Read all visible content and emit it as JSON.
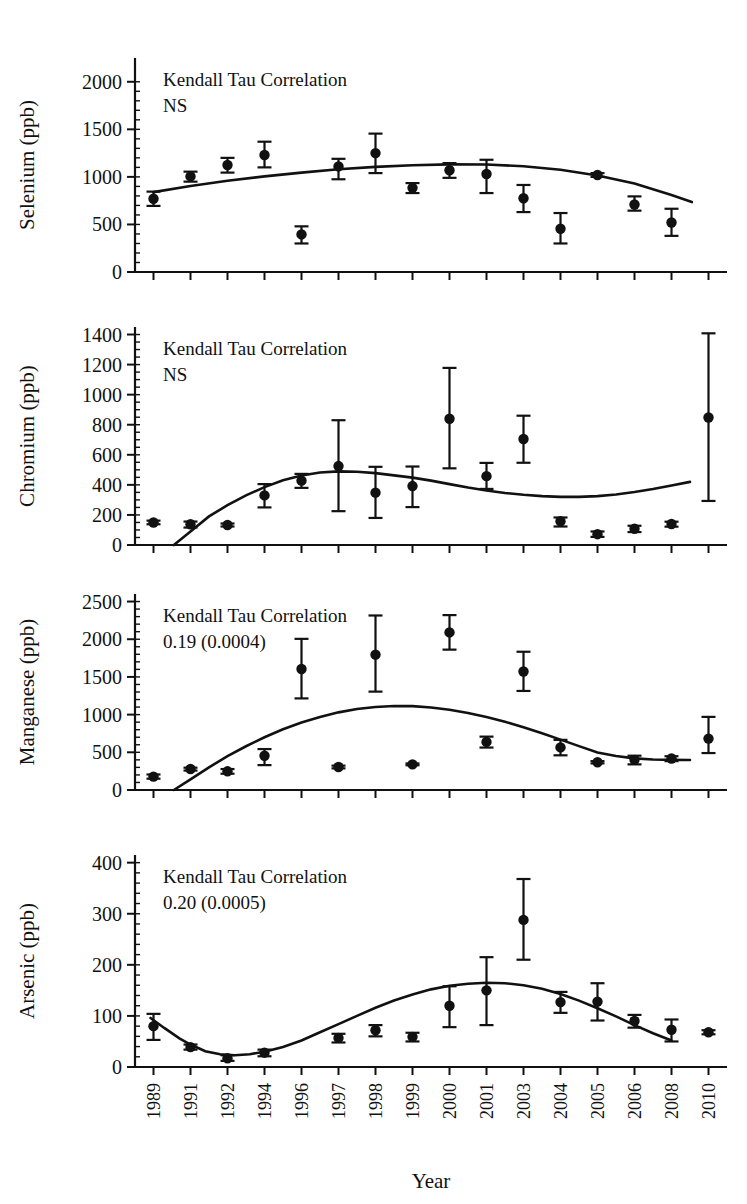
{
  "figure": {
    "top_partial_text": " ",
    "xaxis_title": "Year",
    "categories": [
      "1989",
      "1991",
      "1992",
      "1994",
      "1996",
      "1997",
      "1998",
      "1999",
      "2000",
      "2001",
      "2003",
      "2004",
      "2005",
      "2006",
      "2008",
      "2010"
    ]
  },
  "chart_data": [
    {
      "type": "scatter",
      "title": "",
      "panel_name": "selenium",
      "xlabel": "Year",
      "ylabel": "Selenium (ppb)",
      "ylim": [
        0,
        2250
      ],
      "yticks": [
        0,
        500,
        1000,
        1500,
        2000
      ],
      "yminor_step": 100,
      "grid": false,
      "legend": "none",
      "annotation_line1": "Kendall Tau Correlation",
      "annotation_line2": "NS",
      "categories": [
        "1989",
        "1991",
        "1992",
        "1994",
        "1996",
        "1997",
        "1998",
        "1999",
        "2000",
        "2001",
        "2003",
        "2004",
        "2005",
        "2006",
        "2008",
        "2010"
      ],
      "values": [
        770,
        1005,
        1125,
        1230,
        395,
        1110,
        1250,
        885,
        1070,
        1030,
        775,
        455,
        1020,
        710,
        520,
        null
      ],
      "err_low": [
        75,
        55,
        80,
        130,
        95,
        135,
        210,
        55,
        80,
        200,
        145,
        155,
        20,
        65,
        140,
        null
      ],
      "err_high": [
        75,
        50,
        75,
        140,
        85,
        80,
        205,
        50,
        75,
        150,
        140,
        165,
        20,
        85,
        145,
        null
      ],
      "x_index": [
        0,
        1,
        2,
        3,
        4,
        5,
        6,
        7,
        8,
        9,
        10,
        11,
        12,
        13,
        14,
        null
      ],
      "fit_points": [
        [
          0.0,
          840
        ],
        [
          1.0,
          905
        ],
        [
          2.0,
          960
        ],
        [
          3.0,
          1005
        ],
        [
          4.0,
          1045
        ],
        [
          5.0,
          1080
        ],
        [
          6.0,
          1105
        ],
        [
          7.0,
          1122
        ],
        [
          8.0,
          1132
        ],
        [
          9.0,
          1130
        ],
        [
          10.0,
          1112
        ],
        [
          11.0,
          1075
        ],
        [
          12.0,
          1015
        ],
        [
          13.0,
          930
        ],
        [
          14.0,
          810
        ],
        [
          14.55,
          735
        ]
      ],
      "extra_point_note": "2010 point at ~520 plotted at index 15"
    },
    {
      "type": "scatter",
      "title": "",
      "panel_name": "chromium",
      "xlabel": "Year",
      "ylabel": "Chromium (ppb)",
      "ylim": [
        0,
        1450
      ],
      "yticks": [
        0,
        200,
        400,
        600,
        800,
        1000,
        1200,
        1400
      ],
      "yminor_step": 50,
      "grid": false,
      "legend": "none",
      "annotation_line1": "Kendall Tau Correlation",
      "annotation_line2": "NS",
      "categories": [
        "1989",
        "1991",
        "1992",
        "1994",
        "1996",
        "1997",
        "1998",
        "1999",
        "2000",
        "2001",
        "2003",
        "2004",
        "2005",
        "2006",
        "2008",
        "2010"
      ],
      "values": [
        150,
        138,
        133,
        330,
        428,
        525,
        348,
        392,
        840,
        458,
        705,
        158,
        72,
        108,
        140,
        848
      ],
      "err_low": [
        12,
        22,
        10,
        80,
        48,
        300,
        168,
        140,
        330,
        85,
        158,
        35,
        18,
        22,
        18,
        555
      ],
      "err_high": [
        12,
        18,
        10,
        75,
        45,
        305,
        172,
        130,
        338,
        88,
        155,
        25,
        18,
        20,
        15,
        560
      ],
      "fit_points": [
        [
          0.55,
          0
        ],
        [
          1.0,
          90
        ],
        [
          1.5,
          190
        ],
        [
          2.0,
          265
        ],
        [
          2.5,
          330
        ],
        [
          3.0,
          385
        ],
        [
          3.5,
          430
        ],
        [
          4.0,
          462
        ],
        [
          4.5,
          482
        ],
        [
          5.0,
          490
        ],
        [
          5.5,
          487
        ],
        [
          6.0,
          478
        ],
        [
          6.5,
          463
        ],
        [
          7.0,
          448
        ],
        [
          7.5,
          428
        ],
        [
          8.0,
          405
        ],
        [
          8.5,
          382
        ],
        [
          9.0,
          362
        ],
        [
          9.5,
          346
        ],
        [
          10.0,
          334
        ],
        [
          10.5,
          325
        ],
        [
          11.0,
          320
        ],
        [
          11.5,
          320
        ],
        [
          12.0,
          325
        ],
        [
          12.5,
          336
        ],
        [
          13.0,
          352
        ],
        [
          13.5,
          372
        ],
        [
          14.0,
          396
        ],
        [
          14.5,
          420
        ]
      ]
    },
    {
      "type": "scatter",
      "title": "",
      "panel_name": "manganese",
      "xlabel": "Year",
      "ylabel": "Manganese (ppb)",
      "ylim": [
        0,
        2600
      ],
      "yticks": [
        0,
        500,
        1000,
        1500,
        2000,
        2500
      ],
      "yminor_step": 100,
      "grid": false,
      "legend": "none",
      "annotation_line1": "Kendall Tau Correlation",
      "annotation_line2": "0.19 (0.0004)",
      "categories": [
        "1989",
        "1991",
        "1992",
        "1994",
        "1996",
        "1997",
        "1998",
        "1999",
        "2000",
        "2001",
        "2003",
        "2004",
        "2005",
        "2006",
        "2008",
        "2010"
      ],
      "values": [
        178,
        278,
        248,
        455,
        1605,
        305,
        1795,
        340,
        2090,
        638,
        1572,
        565,
        368,
        400,
        418,
        682
      ],
      "err_low": [
        28,
        20,
        32,
        125,
        390,
        18,
        490,
        12,
        228,
        75,
        258,
        105,
        15,
        60,
        35,
        192
      ],
      "err_high": [
        28,
        18,
        30,
        88,
        400,
        18,
        520,
        12,
        230,
        70,
        262,
        100,
        15,
        55,
        30,
        288
      ],
      "fit_points": [
        [
          0.55,
          0
        ],
        [
          1.0,
          140
        ],
        [
          1.5,
          300
        ],
        [
          2.0,
          450
        ],
        [
          2.5,
          580
        ],
        [
          3.0,
          700
        ],
        [
          3.5,
          805
        ],
        [
          4.0,
          895
        ],
        [
          4.5,
          968
        ],
        [
          5.0,
          1030
        ],
        [
          5.5,
          1075
        ],
        [
          6.0,
          1102
        ],
        [
          6.5,
          1115
        ],
        [
          7.0,
          1112
        ],
        [
          7.5,
          1095
        ],
        [
          8.0,
          1065
        ],
        [
          8.5,
          1022
        ],
        [
          9.0,
          968
        ],
        [
          9.5,
          905
        ],
        [
          10.0,
          832
        ],
        [
          10.5,
          752
        ],
        [
          11.0,
          668
        ],
        [
          11.5,
          582
        ],
        [
          12.0,
          498
        ],
        [
          12.5,
          450
        ],
        [
          13.0,
          420
        ],
        [
          13.5,
          405
        ],
        [
          14.0,
          400
        ],
        [
          14.5,
          398
        ]
      ]
    },
    {
      "type": "scatter",
      "title": "",
      "panel_name": "arsenic",
      "xlabel": "Year",
      "ylabel": "Arsenic (ppb)",
      "ylim": [
        0,
        415
      ],
      "yticks": [
        0,
        100,
        200,
        300,
        400
      ],
      "yminor_step": 20,
      "grid": false,
      "legend": "none",
      "annotation_line1": "Kendall Tau Correlation",
      "annotation_line2": "0.20 (0.0005)",
      "categories": [
        "1989",
        "1991",
        "1992",
        "1994",
        "1996",
        "1997",
        "1998",
        "1999",
        "2000",
        "2001",
        "2003",
        "2004",
        "2005",
        "2006",
        "2008",
        "2010"
      ],
      "values": [
        80,
        39,
        17,
        28,
        null,
        57,
        72,
        59,
        120,
        150,
        288,
        127,
        128,
        90,
        73,
        68
      ],
      "err_low": [
        27,
        5,
        5,
        7,
        null,
        9,
        12,
        9,
        42,
        68,
        78,
        21,
        37,
        13,
        23,
        4
      ],
      "err_high": [
        24,
        5,
        6,
        6,
        null,
        8,
        10,
        8,
        38,
        65,
        80,
        20,
        36,
        12,
        20,
        4
      ],
      "fit_points": [
        [
          -0.08,
          96
        ],
        [
          0.3,
          76
        ],
        [
          0.7,
          56
        ],
        [
          1.0,
          44
        ],
        [
          1.4,
          31
        ],
        [
          1.8,
          25
        ],
        [
          2.2,
          23
        ],
        [
          2.6,
          25
        ],
        [
          3.0,
          30
        ],
        [
          3.5,
          39
        ],
        [
          4.0,
          52
        ],
        [
          4.5,
          68
        ],
        [
          5.0,
          84
        ],
        [
          5.5,
          100
        ],
        [
          6.0,
          116
        ],
        [
          6.5,
          130
        ],
        [
          7.0,
          142
        ],
        [
          7.5,
          152
        ],
        [
          8.0,
          159
        ],
        [
          8.5,
          163
        ],
        [
          9.0,
          165
        ],
        [
          9.5,
          164
        ],
        [
          10.0,
          160
        ],
        [
          10.5,
          153
        ],
        [
          11.0,
          143
        ],
        [
          11.5,
          130
        ],
        [
          12.0,
          115
        ],
        [
          12.5,
          99
        ],
        [
          13.0,
          82
        ],
        [
          13.5,
          66
        ],
        [
          14.0,
          52
        ]
      ]
    }
  ]
}
